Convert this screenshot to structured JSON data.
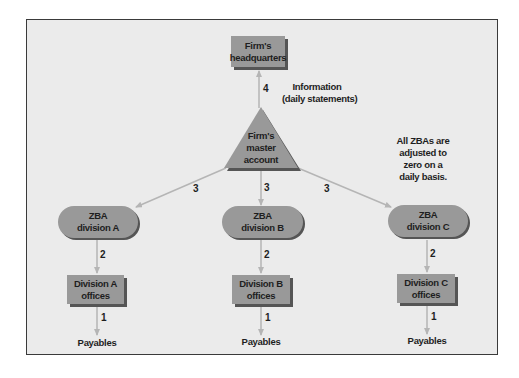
{
  "colors": {
    "background": "#ebebeb",
    "frame_border": "#3a3a3a",
    "node_fill": "#999999",
    "node_shadow": "#555555",
    "connector": "#b5b5b5",
    "text": "#1e1e1e"
  },
  "headquarters": {
    "line1": "Firm's",
    "line2": "headquarters"
  },
  "master_account": {
    "line1": "Firm's",
    "line2": "master",
    "line3": "account"
  },
  "info_note": {
    "line1": "Information",
    "line2": "(daily statements)"
  },
  "zba_note": {
    "line1": "All ZBAs are",
    "line2": "adjusted to",
    "line3": "zero on a",
    "line4": "daily basis."
  },
  "edges": {
    "master_to_hq": "4",
    "master_to_zba_a": "3",
    "master_to_zba_b": "3",
    "master_to_zba_c": "3"
  },
  "divisions": [
    {
      "zba_line1": "ZBA",
      "zba_line2": "division A",
      "office_line1": "Division A",
      "office_line2": "offices",
      "edge_zba_office": "2",
      "edge_office_payables": "1",
      "payables": "Payables"
    },
    {
      "zba_line1": "ZBA",
      "zba_line2": "division B",
      "office_line1": "Division B",
      "office_line2": "offices",
      "edge_zba_office": "2",
      "edge_office_payables": "1",
      "payables": "Payables"
    },
    {
      "zba_line1": "ZBA",
      "zba_line2": "division C",
      "office_line1": "Division C",
      "office_line2": "offices",
      "edge_zba_office": "2",
      "edge_office_payables": "1",
      "payables": "Payables"
    }
  ]
}
